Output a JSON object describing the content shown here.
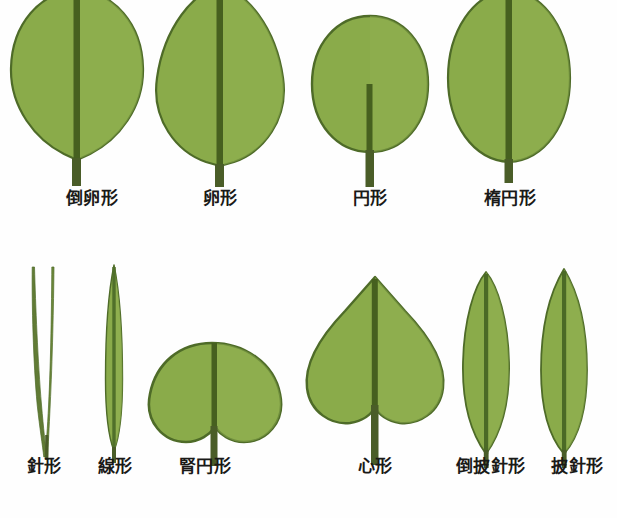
{
  "figure": {
    "background_color": "#fefefe",
    "colors": {
      "leaf_fill": "#8aab4a",
      "leaf_fill_light": "#97b456",
      "leaf_outline": "#4e6b28",
      "midrib": "#46601f",
      "petiole": "#4a5d28",
      "label_text": "#1a1a18"
    }
  },
  "rows": [
    {
      "row_name": "broad-leaf-shapes",
      "items": [
        {
          "label": "倒卵形",
          "shape": "obovate",
          "shape_icon": "leaf-obovate-icon",
          "petiole": "long",
          "label_x": 57,
          "label_y": 197
        },
        {
          "label": "卵形",
          "shape": "ovate",
          "shape_icon": "leaf-ovate-icon",
          "petiole": "long",
          "label_x": 200,
          "label_y": 197
        },
        {
          "label": "円形",
          "shape": "orbicular",
          "shape_icon": "leaf-orbicular-icon",
          "petiole": "long",
          "label_x": 340,
          "label_y": 197
        },
        {
          "label": "楕円形",
          "shape": "elliptic",
          "shape_icon": "leaf-elliptic-icon",
          "petiole": "short",
          "label_x": 470,
          "label_y": 197
        }
      ]
    },
    {
      "row_name": "narrow-and-lobed-leaf-shapes",
      "items": [
        {
          "label": "針形",
          "shape": "acicular",
          "shape_icon": "leaf-acicular-icon",
          "petiole": "none",
          "label_x": 17,
          "label_y": 465
        },
        {
          "label": "線形",
          "shape": "linear",
          "shape_icon": "leaf-linear-icon",
          "petiole": "short",
          "label_x": 88,
          "label_y": 465
        },
        {
          "label": "腎円形",
          "shape": "reniform",
          "shape_icon": "leaf-reniform-icon",
          "petiole": "long",
          "label_x": 168,
          "label_y": 465
        },
        {
          "label": "心形",
          "shape": "cordate",
          "shape_icon": "leaf-cordate-icon",
          "petiole": "long",
          "label_x": 344,
          "label_y": 465
        },
        {
          "label": "倒披針形",
          "shape": "oblanceolate",
          "shape_icon": "leaf-oblanceolate-icon",
          "petiole": "short",
          "label_x": 443,
          "label_y": 465
        },
        {
          "label": "披針形",
          "shape": "lanceolate",
          "shape_icon": "leaf-lanceolate-icon",
          "petiole": "short",
          "label_x": 545,
          "label_y": 465
        }
      ]
    }
  ]
}
